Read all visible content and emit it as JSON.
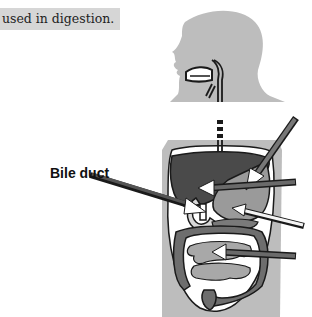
{
  "caption": {
    "text": "used in digestion."
  },
  "labels": {
    "bile_duct": "Bile duct"
  },
  "figure": {
    "arrows": [
      {
        "target": "bile-duct",
        "labeled": true
      },
      {
        "target": "stomach",
        "labeled": false
      },
      {
        "target": "liver-gallbladder",
        "labeled": false
      },
      {
        "target": "pancreas",
        "labeled": false
      },
      {
        "target": "small-intestine",
        "labeled": false
      }
    ],
    "colors": {
      "body_silhouette": "#bdbdbd",
      "liver": "#4a4a4a",
      "stomach": "#9a9a9a",
      "intestine_large": "#6e6e6e",
      "intestine_small": "#a8a8a8",
      "outline": "#1a1a1a",
      "caption_bg": "#d6d6d6"
    }
  }
}
